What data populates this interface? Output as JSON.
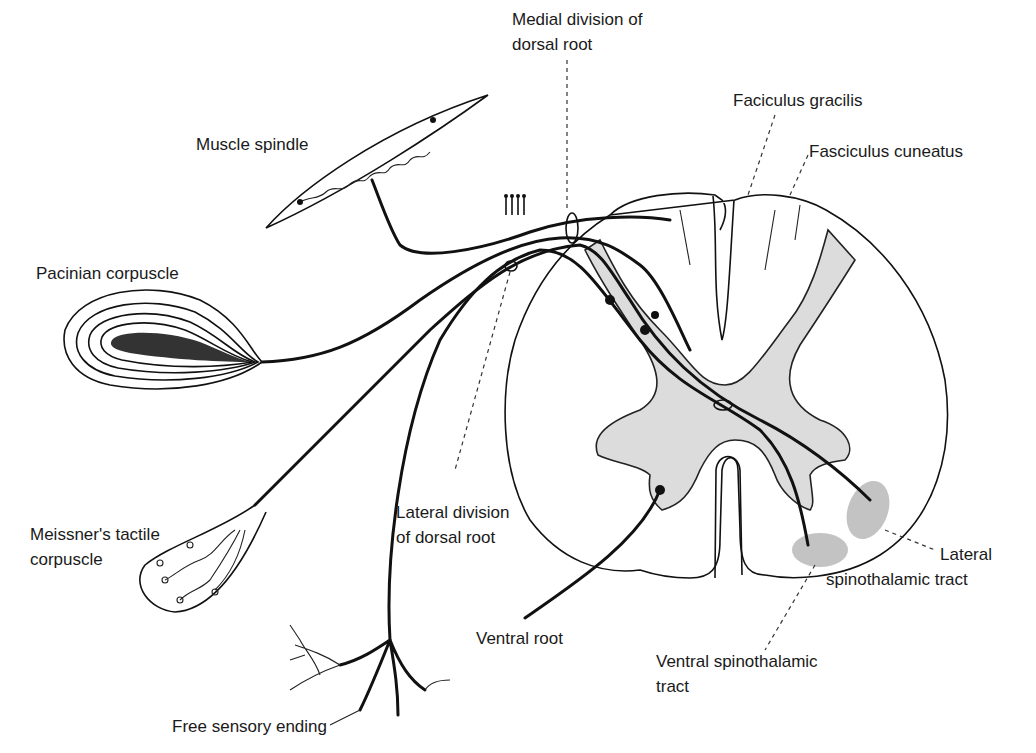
{
  "diagram": {
    "type": "anatomical line drawing",
    "colors": {
      "line": "#111111",
      "grey_matter": "#dcdcdc",
      "tract_fill": "#bdbdbd",
      "background": "#ffffff"
    },
    "labels": {
      "muscle_spindle": "Muscle spindle",
      "pacinian": "Pacinian corpuscle",
      "meissner_line1": "Meissner's tactile",
      "meissner_line2": "corpuscle",
      "free_ending": "Free sensory ending",
      "medial_div_line1": "Medial division of",
      "medial_div_line2": "dorsal root",
      "lateral_div_line1": "Lateral division",
      "lateral_div_line2": "of dorsal root",
      "ventral_root": "Ventral root",
      "gracilis": "Faciculus gracilis",
      "cuneatus": "Fasciculus cuneatus",
      "lat_st_line1": "Lateral",
      "lat_st_line2": "spinothalamic tract",
      "ven_st_line1": "Ventral spinothalamic",
      "ven_st_line2": "tract"
    }
  }
}
